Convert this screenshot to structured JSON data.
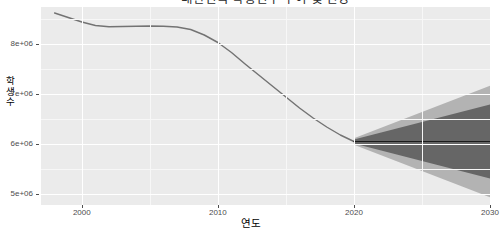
{
  "chart_data": {
    "type": "line",
    "title": "대한민국 학령인구 추이 및 전망",
    "xlabel": "연도",
    "ylabel": "학생수",
    "xlim": [
      1997,
      2030
    ],
    "ylim": [
      4780000,
      8740000
    ],
    "grid": true,
    "legend_position": "none",
    "x_ticks": [
      2000,
      2010,
      2020,
      2030
    ],
    "x_tick_labels": [
      "2000",
      "2010",
      "2020",
      "2030"
    ],
    "y_ticks": [
      5000000,
      6000000,
      7000000,
      8000000
    ],
    "y_tick_labels": [
      "5e+06",
      "6e+06",
      "7e+06",
      "8e+06"
    ],
    "y_minor_ticks": [
      5500000,
      6500000,
      7500000,
      8500000
    ],
    "x_minor_ticks": [
      1995,
      2005,
      2015,
      2025
    ],
    "series": [
      {
        "name": "historical",
        "type": "line",
        "color": "#737373",
        "x": [
          1998,
          1999,
          2000,
          2001,
          2002,
          2003,
          2004,
          2005,
          2006,
          2007,
          2008,
          2009,
          2010,
          2011,
          2012,
          2013,
          2014,
          2015,
          2016,
          2017,
          2018,
          2019,
          2020
        ],
        "values": [
          8620000,
          8530000,
          8440000,
          8370000,
          8345000,
          8350000,
          8355000,
          8360000,
          8355000,
          8340000,
          8290000,
          8180000,
          8030000,
          7830000,
          7600000,
          7380000,
          7160000,
          6940000,
          6720000,
          6520000,
          6340000,
          6180000,
          6050000
        ]
      },
      {
        "name": "forecast mean",
        "type": "line",
        "color": "#1a1a1a",
        "x": [
          2020,
          2021,
          2022,
          2023,
          2024,
          2025,
          2026,
          2027,
          2028,
          2029,
          2030
        ],
        "values": [
          6050000,
          6050000,
          6050000,
          6050000,
          6050000,
          6050000,
          6050000,
          6050000,
          6050000,
          6050000,
          6050000
        ]
      },
      {
        "name": "80% prediction interval",
        "type": "ribbon",
        "color": "#666666",
        "x": [
          2020,
          2021,
          2022,
          2023,
          2024,
          2025,
          2026,
          2027,
          2028,
          2029,
          2030
        ],
        "lower": [
          6010000,
          5940000,
          5870000,
          5800000,
          5730000,
          5660000,
          5590000,
          5520000,
          5450000,
          5380000,
          5310000
        ],
        "upper": [
          6090000,
          6160000,
          6230000,
          6300000,
          6370000,
          6440000,
          6510000,
          6580000,
          6650000,
          6720000,
          6790000
        ]
      },
      {
        "name": "95% prediction interval",
        "type": "ribbon",
        "color": "#b3b3b3",
        "x": [
          2020,
          2021,
          2022,
          2023,
          2024,
          2025,
          2026,
          2027,
          2028,
          2029,
          2030
        ],
        "lower": [
          5985000,
          5880000,
          5775000,
          5670000,
          5565000,
          5460000,
          5355000,
          5250000,
          5145000,
          5040000,
          4935000
        ],
        "upper": [
          6115000,
          6220000,
          6325000,
          6430000,
          6535000,
          6640000,
          6745000,
          6850000,
          6955000,
          7060000,
          7165000
        ]
      }
    ],
    "annotations": [],
    "colors": {
      "panel_background": "#ebebeb",
      "grid_major": "#ffffff",
      "grid_minor": "#f7f7f7",
      "historical_line": "#737373",
      "forecast_line": "#1a1a1a",
      "band_80": "#666666",
      "band_95": "#b3b3b3",
      "axis_text": "#4d4d4d"
    }
  },
  "ylabel_chars": [
    "학",
    "생",
    "수"
  ]
}
